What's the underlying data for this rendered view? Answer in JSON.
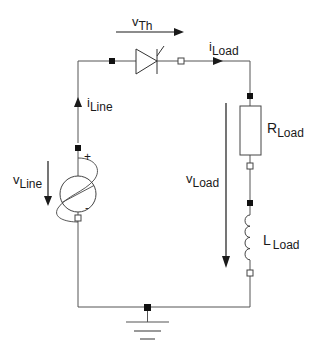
{
  "diagram": {
    "type": "circuit-schematic",
    "labels": {
      "v_th": {
        "main": "v",
        "sub": "Th"
      },
      "i_load": {
        "main": "i",
        "sub": "Load"
      },
      "i_line": {
        "main": "i",
        "sub": "Line"
      },
      "r_load": {
        "main": "R",
        "sub": "Load"
      },
      "v_load": {
        "main": "v",
        "sub": "Load"
      },
      "l_load": {
        "main": "L",
        "sub": "Load"
      },
      "v_line": {
        "main": "v",
        "sub": "Line"
      },
      "plus": "+",
      "minus": "-"
    },
    "components": [
      {
        "id": "source",
        "kind": "ac-voltage-source",
        "label": "vLine"
      },
      {
        "id": "thyristor",
        "kind": "thyristor",
        "label": "vTh"
      },
      {
        "id": "resistor",
        "kind": "resistor",
        "label": "RLoad"
      },
      {
        "id": "inductor",
        "kind": "inductor",
        "label": "LLoad"
      },
      {
        "id": "ground",
        "kind": "ground"
      }
    ],
    "colors": {
      "wire": "#555555",
      "ink": "#1a1a1a",
      "background": "#ffffff"
    }
  }
}
